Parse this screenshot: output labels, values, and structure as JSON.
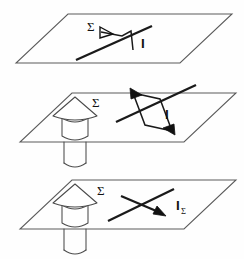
{
  "figure": {
    "background_color": "#fefefe",
    "ink_color": "#1a1a1a",
    "plane_stroke_color": "#5a5a5a",
    "body_stroke_color": "#4a4a4a",
    "panel_count": 3
  },
  "panels": [
    {
      "id": "panel-top",
      "index": 1,
      "surface_label": "Σ",
      "current_label": "I",
      "has_body": false,
      "has_loop": true,
      "loop_style": "open-polyline",
      "has_cancel_stroke": false,
      "description": "Plane Sigma pierced by a straight current line I with an oriented contour"
    },
    {
      "id": "panel-middle",
      "index": 2,
      "surface_label": "Σ",
      "current_label": "I",
      "has_body": true,
      "has_loop": true,
      "loop_style": "closed-parallelogram",
      "has_cancel_stroke": false,
      "description": "Plane Sigma with cone-and-cylinder body piercing it, plus current line I and closed contour"
    },
    {
      "id": "panel-bottom",
      "index": 3,
      "surface_label": "Σ",
      "current_label": "I",
      "current_label_subscript": "Σ",
      "has_body": true,
      "has_loop": false,
      "loop_style": "none",
      "has_cancel_stroke": true,
      "description": "Plane Sigma with cone-and-cylinder body, current line crossed by an arrow labelled I subscript Sigma"
    }
  ],
  "labels": {
    "sigma": "Σ",
    "current": "I",
    "current_subscript": "Σ"
  },
  "background_bleed": {
    "visible": true,
    "legible": false,
    "text": "                                                                                                                                                                                                                                                                                                                                                                                                                                                                                                                                                                                                                                                                                                                                "
  }
}
